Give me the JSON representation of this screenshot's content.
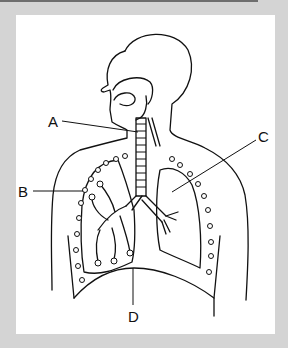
{
  "figure": {
    "labels": [
      {
        "id": "A",
        "text": "A",
        "points_to": "trachea"
      },
      {
        "id": "B",
        "text": "B",
        "points_to": "left lung (bronchioles/alveoli)"
      },
      {
        "id": "C",
        "text": "C",
        "points_to": "right lung"
      },
      {
        "id": "D",
        "text": "D",
        "points_to": "diaphragm"
      }
    ]
  },
  "colors": {
    "background": "#d4d4d4",
    "panel": "#ffffff",
    "line": "#111111"
  }
}
